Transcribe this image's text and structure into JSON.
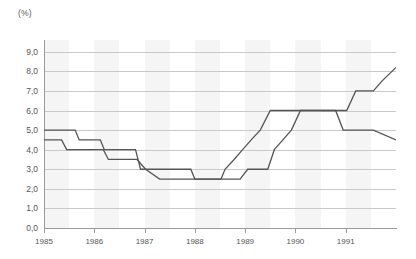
{
  "chart_data": {
    "type": "line",
    "line_style": "step",
    "title": "",
    "subtitle": "",
    "xlabel": "",
    "ylabel": "(%)",
    "unit_label": "(%)",
    "xlim": [
      1985.0,
      1992.0
    ],
    "ylim": [
      0.0,
      9.6
    ],
    "grid": true,
    "grid_axis": "y",
    "legend": false,
    "legend_position": "none",
    "x_tick_labels": [
      "1985",
      "1986",
      "1987",
      "1988",
      "1989",
      "1990",
      "1991"
    ],
    "x_tick_values": [
      1985,
      1986,
      1987,
      1988,
      1989,
      1990,
      1991
    ],
    "y_tick_labels": [
      "0,0",
      "1,0",
      "2,0",
      "3,0",
      "4,0",
      "5,0",
      "6,0",
      "7,0",
      "8,0",
      "9,0"
    ],
    "y_tick_values": [
      0.0,
      1.0,
      2.0,
      3.0,
      4.0,
      5.0,
      6.0,
      7.0,
      8.0,
      9.0
    ],
    "decimal_separator": ",",
    "series": [
      {
        "name": "series-upper",
        "color": "#555555",
        "points": [
          [
            1985.0,
            5.0
          ],
          [
            1985.62,
            5.0
          ],
          [
            1985.7,
            4.5
          ],
          [
            1986.12,
            4.5
          ],
          [
            1986.2,
            4.0
          ],
          [
            1986.82,
            4.0
          ],
          [
            1986.92,
            3.0
          ],
          [
            1987.55,
            3.0
          ],
          [
            1987.92,
            3.0
          ],
          [
            1988.0,
            2.5
          ],
          [
            1988.52,
            2.5
          ],
          [
            1988.6,
            3.0
          ],
          [
            1988.78,
            3.5
          ],
          [
            1988.95,
            4.0
          ],
          [
            1989.12,
            4.5
          ],
          [
            1989.3,
            5.0
          ],
          [
            1989.5,
            6.0
          ],
          [
            1990.45,
            6.0
          ],
          [
            1990.6,
            6.0
          ],
          [
            1991.02,
            6.0
          ],
          [
            1991.2,
            7.0
          ],
          [
            1991.55,
            7.0
          ],
          [
            1991.72,
            7.5
          ],
          [
            1992.0,
            8.2
          ]
        ]
      },
      {
        "name": "series-lower",
        "color": "#555555",
        "points": [
          [
            1985.0,
            4.5
          ],
          [
            1985.35,
            4.5
          ],
          [
            1985.45,
            4.0
          ],
          [
            1986.18,
            4.0
          ],
          [
            1986.28,
            3.5
          ],
          [
            1986.85,
            3.5
          ],
          [
            1987.02,
            3.0
          ],
          [
            1987.3,
            2.5
          ],
          [
            1988.9,
            2.5
          ],
          [
            1989.05,
            3.0
          ],
          [
            1989.45,
            3.0
          ],
          [
            1989.58,
            4.0
          ],
          [
            1989.75,
            4.5
          ],
          [
            1989.92,
            5.0
          ],
          [
            1990.1,
            6.0
          ],
          [
            1990.8,
            6.0
          ],
          [
            1990.95,
            5.0
          ],
          [
            1991.55,
            5.0
          ],
          [
            1992.0,
            4.5
          ]
        ]
      }
    ],
    "bands": [
      {
        "from": 1985.0,
        "to": 1985.5
      },
      {
        "from": 1986.0,
        "to": 1986.5
      },
      {
        "from": 1987.0,
        "to": 1987.5
      },
      {
        "from": 1988.0,
        "to": 1988.5
      },
      {
        "from": 1989.0,
        "to": 1989.5
      },
      {
        "from": 1990.0,
        "to": 1990.5
      },
      {
        "from": 1991.0,
        "to": 1991.5
      }
    ],
    "colors": {
      "series": "#555555",
      "gridline": "#c9c9c9",
      "axis": "#9a9a9a",
      "band": "#f2f2f2",
      "text": "#555555",
      "background": "#ffffff"
    }
  }
}
